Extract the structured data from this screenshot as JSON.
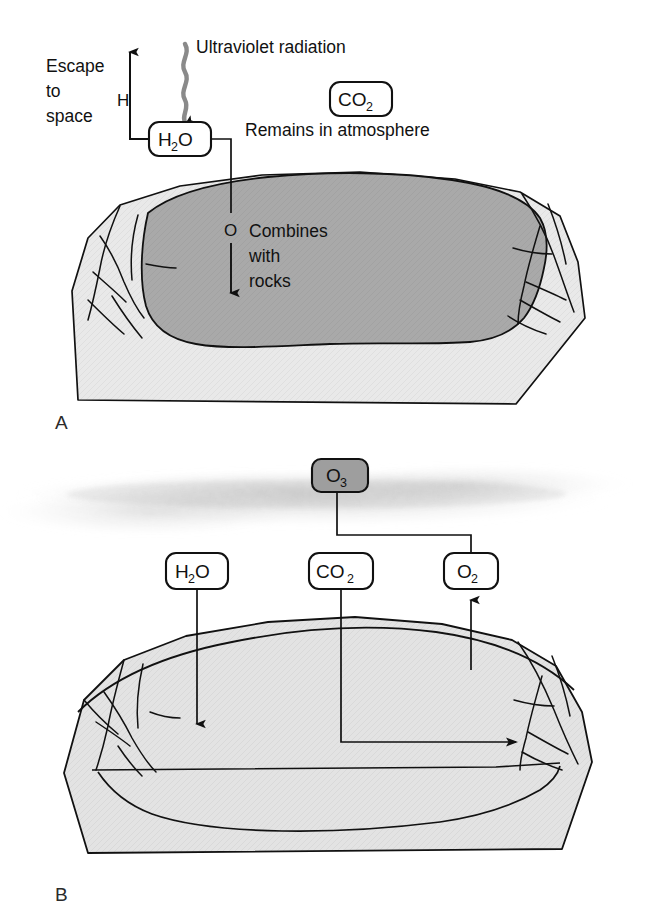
{
  "figure": {
    "type": "two-panel scientific block diagram of planetary atmosphere evolution",
    "background_color": "#ffffff",
    "ink_color": "#111111"
  },
  "panels": [
    {
      "id": "A",
      "letter": "A",
      "caption_labels": {
        "escape_line1": "Escape",
        "escape_line2": "to",
        "escape_line3": "space",
        "uv": "Ultraviolet radiation",
        "remains": "Remains in atmosphere",
        "combines_line1": "Combines",
        "combines_line2": "with",
        "combines_line3": "rocks"
      },
      "molecule_boxes": [
        {
          "id": "h2o-a",
          "formula": "H",
          "sub": "2",
          "tail": "O",
          "fill": "#ffffff"
        },
        {
          "id": "co2-a",
          "formula": "CO",
          "sub": "2",
          "tail": "",
          "fill": "#ffffff"
        }
      ],
      "atoms": [
        {
          "id": "hydrogen",
          "symbol": "H",
          "direction": "up",
          "meaning": "escapes to space"
        },
        {
          "id": "oxygen",
          "symbol": "O",
          "direction": "down",
          "meaning": "combines with rocks"
        }
      ],
      "terrain": {
        "outer_fill": "#e9e9e9",
        "inner_fill": "#a9a9a9",
        "description": "block diagram of eroded landmass with dark interior plateau"
      }
    },
    {
      "id": "B",
      "letter": "B",
      "ozone_band": {
        "label": "ozone layer haze band",
        "color": "#9a9a9a"
      },
      "molecule_boxes": [
        {
          "id": "o3-b",
          "formula": "O",
          "sub": "3",
          "tail": "",
          "fill": "#9e9e9e"
        },
        {
          "id": "h2o-b",
          "formula": "H",
          "sub": "2",
          "tail": "O",
          "fill": "#ffffff"
        },
        {
          "id": "co2-b",
          "formula": "CO",
          "sub": "2",
          "tail": "",
          "fill": "#ffffff"
        },
        {
          "id": "o2-b",
          "formula": "O",
          "sub": "2",
          "tail": "",
          "fill": "#ffffff"
        }
      ],
      "arrows": [
        {
          "id": "h2o-down",
          "from": "H2O",
          "direction": "down",
          "meaning": "rains onto surface"
        },
        {
          "id": "co2-into-rock",
          "from": "CO2",
          "direction": "down-then-right",
          "meaning": "enters crust"
        },
        {
          "id": "o2-up",
          "from": "surface",
          "direction": "up",
          "meaning": "oxygen released to atmosphere"
        },
        {
          "id": "o3-link",
          "from": "O2",
          "to": "O3",
          "direction": "connector",
          "meaning": "O2 converts to ozone"
        }
      ],
      "terrain": {
        "outer_fill": "#e3e3e3",
        "description": "block diagram of eroded landmass with flat top surface"
      }
    }
  ]
}
